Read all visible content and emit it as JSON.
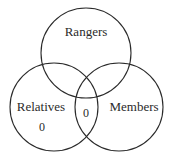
{
  "diagram": {
    "type": "venn",
    "stroke_color": "#2a2a2a",
    "sets": [
      {
        "id": "rangers",
        "label": "Rangers",
        "circle": {
          "cx": 86,
          "cy": 53,
          "r": 45
        },
        "label_pos": {
          "x": 86,
          "y": 36
        }
      },
      {
        "id": "relatives",
        "label": "Relatives",
        "circle": {
          "cx": 54,
          "cy": 107,
          "r": 44
        },
        "label_pos": {
          "x": 41,
          "y": 111
        }
      },
      {
        "id": "members",
        "label": "Members",
        "circle": {
          "cx": 119,
          "cy": 107,
          "r": 44
        },
        "label_pos": {
          "x": 134,
          "y": 111
        }
      }
    ],
    "region_values": [
      {
        "region": "relatives-only",
        "value": "0",
        "pos": {
          "x": 42,
          "y": 131
        }
      },
      {
        "region": "relatives-and-members-only",
        "value": "0",
        "pos": {
          "x": 86,
          "y": 117
        }
      }
    ]
  }
}
